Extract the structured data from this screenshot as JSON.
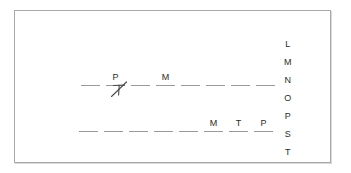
{
  "worksheet": {
    "title": "Word Puzzle Worksheet",
    "frame_color": "#a9a9a9",
    "background_color": "#ffffff",
    "text_color": "#2b2b2b",
    "blank_color": "#9a9a9a"
  },
  "puzzle": {
    "rows": [
      {
        "id": "row-1",
        "name": "answer-row-1",
        "slots": [
          {
            "letter": "",
            "filled": false
          },
          {
            "letter": "P",
            "filled": true
          },
          {
            "letter": "",
            "filled": false
          },
          {
            "letter": "M",
            "filled": true
          },
          {
            "letter": "",
            "filled": false
          },
          {
            "letter": "",
            "filled": false
          },
          {
            "letter": "",
            "filled": false
          },
          {
            "letter": "",
            "filled": false
          }
        ]
      },
      {
        "id": "row-2",
        "name": "answer-row-2",
        "slots": [
          {
            "letter": "",
            "filled": false
          },
          {
            "letter": "",
            "filled": false
          },
          {
            "letter": "",
            "filled": false
          },
          {
            "letter": "",
            "filled": false
          },
          {
            "letter": "",
            "filled": false
          },
          {
            "letter": "M",
            "filled": true
          },
          {
            "letter": "T",
            "filled": true
          },
          {
            "letter": "P",
            "filled": true
          }
        ]
      }
    ]
  },
  "guess_mark": {
    "name": "crossed-out-letter-t",
    "letter": "T",
    "state": "crossed-out",
    "color": "#4a4a4a"
  },
  "letter_column": {
    "name": "letter-bank",
    "letters": [
      "L",
      "M",
      "N",
      "O",
      "P",
      "S",
      "T"
    ]
  }
}
